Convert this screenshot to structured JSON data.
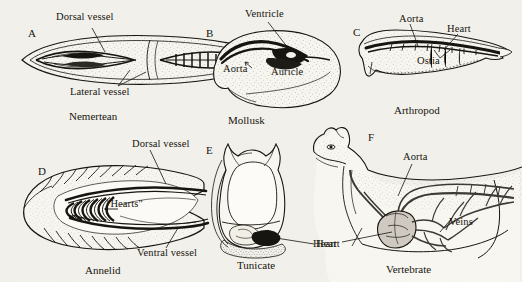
{
  "figure": {
    "background_color": "#f2f0ea",
    "ink_color": "#16150f",
    "width": 522,
    "height": 282
  },
  "panels": [
    {
      "letter": "A",
      "caption": "Nemertean",
      "labels": [
        "Dorsal vessel",
        "Lateral vessel"
      ]
    },
    {
      "letter": "B",
      "caption": "Mollusk",
      "labels": [
        "Ventricle",
        "Aorta",
        "Auricle"
      ]
    },
    {
      "letter": "C",
      "caption": "Arthropod",
      "labels": [
        "Aorta",
        "Heart",
        "Ostia"
      ]
    },
    {
      "letter": "D",
      "caption": "Annelid",
      "labels": [
        "Dorsal vessel",
        "\"Hearts\"",
        "Ventral vessel"
      ]
    },
    {
      "letter": "E",
      "caption": "Tunicate",
      "labels": [
        "Heart"
      ]
    },
    {
      "letter": "F",
      "caption": "Vertebrate",
      "labels": [
        "Aorta",
        "Heart",
        "Veins"
      ]
    }
  ]
}
